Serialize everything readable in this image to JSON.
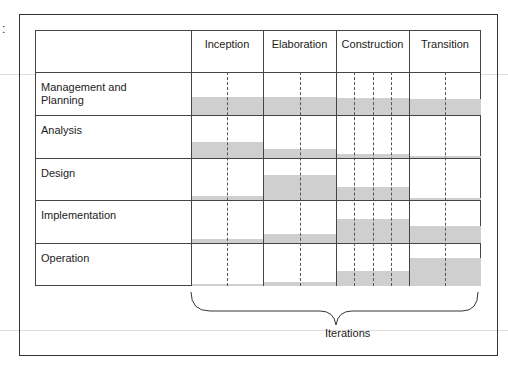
{
  "diagram": {
    "phases": [
      "Inception",
      "Elaboration",
      "Construction",
      "Transition"
    ],
    "disciplines": [
      "Management and Planning",
      "Analysis",
      "Design",
      "Implementation",
      "Operation"
    ],
    "bottom_label": "Iterations",
    "corner_mark": ":"
  },
  "chart_data": {
    "type": "heatmap",
    "title": "",
    "categories": [
      "Inception",
      "Elaboration",
      "Construction",
      "Transition"
    ],
    "series": [
      {
        "name": "Management and Planning",
        "values": [
          0.42,
          0.42,
          0.4,
          0.38
        ]
      },
      {
        "name": "Analysis",
        "values": [
          0.38,
          0.2,
          0.1,
          0.05
        ]
      },
      {
        "name": "Design",
        "values": [
          0.1,
          0.6,
          0.3,
          0.05
        ]
      },
      {
        "name": "Implementation",
        "values": [
          0.1,
          0.2,
          0.55,
          0.4
        ]
      },
      {
        "name": "Operation",
        "values": [
          0.05,
          0.1,
          0.35,
          0.65
        ]
      }
    ],
    "iterations_per_phase": [
      2,
      2,
      4,
      2
    ]
  }
}
